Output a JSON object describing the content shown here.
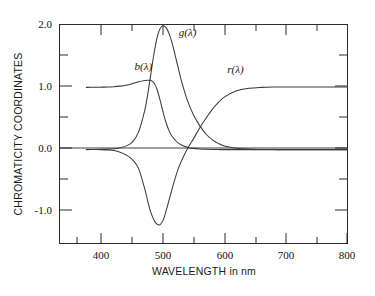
{
  "chart_data": {
    "type": "line",
    "title": "",
    "xlabel": "WAVELENGTH in nm",
    "ylabel": "CHROMATICITY COORDINATES",
    "xlim": [
      332,
      800
    ],
    "ylim": [
      -1.5,
      2.0
    ],
    "grid": false,
    "legend": "inline-curve-labels",
    "x_major_ticks": [
      400,
      500,
      600,
      700,
      800
    ],
    "x_minor_ticks": [
      375,
      450,
      550,
      650,
      750
    ],
    "x_tick_labels": [
      "400",
      "500",
      "600",
      "700",
      "800"
    ],
    "y_major_ticks": [
      -1.0,
      0.0,
      1.0,
      2.0
    ],
    "y_minor_ticks": [
      -0.5,
      0.5,
      1.5
    ],
    "y_tick_labels": [
      "-1.0",
      "0.0",
      "1.0",
      "2.0"
    ],
    "x": [
      375,
      390,
      400,
      410,
      420,
      430,
      440,
      450,
      460,
      470,
      475,
      480,
      485,
      490,
      495,
      500,
      505,
      510,
      515,
      520,
      525,
      530,
      540,
      550,
      560,
      570,
      580,
      590,
      600,
      620,
      640,
      660,
      680,
      700,
      730,
      760,
      800
    ],
    "series": [
      {
        "name": "b(λ)",
        "label": "b(λ)",
        "label_x": 468,
        "label_y": 1.28,
        "values": [
          0.995,
          0.997,
          0.999,
          1.0,
          1.005,
          1.015,
          1.03,
          1.055,
          1.085,
          1.105,
          1.11,
          1.105,
          1.07,
          0.97,
          0.8,
          0.6,
          0.43,
          0.3,
          0.21,
          0.15,
          0.105,
          0.075,
          0.04,
          0.02,
          0.01,
          0.005,
          0.002,
          0.001,
          0.0,
          0.0,
          0.0,
          0.0,
          0.0,
          0.0,
          0.0,
          0.0,
          0.0
        ]
      },
      {
        "name": "g(λ)",
        "label": "g(λ)",
        "label_x": 540,
        "label_y": 1.82,
        "values": [
          0.0,
          0.002,
          0.004,
          0.008,
          0.015,
          0.03,
          0.06,
          0.12,
          0.28,
          0.62,
          0.88,
          1.2,
          1.52,
          1.78,
          1.93,
          1.98,
          1.95,
          1.85,
          1.7,
          1.5,
          1.3,
          1.1,
          0.78,
          0.55,
          0.38,
          0.25,
          0.16,
          0.1,
          0.06,
          0.022,
          0.008,
          0.003,
          0.001,
          0.0,
          0.0,
          0.0,
          0.0
        ]
      },
      {
        "name": "r(λ)",
        "label": "r(λ)",
        "label_x": 618,
        "label_y": 1.22,
        "values": [
          0.003,
          0.002,
          0.0,
          -0.005,
          -0.015,
          -0.04,
          -0.085,
          -0.16,
          -0.3,
          -0.62,
          -0.82,
          -1.0,
          -1.12,
          -1.19,
          -1.2,
          -1.13,
          -0.98,
          -0.8,
          -0.62,
          -0.45,
          -0.3,
          -0.18,
          0.02,
          0.18,
          0.35,
          0.5,
          0.64,
          0.75,
          0.84,
          0.94,
          0.98,
          0.995,
          1.0,
          1.0,
          1.0,
          1.0,
          1.0
        ]
      }
    ]
  },
  "axis": {
    "x_title": "WAVELENGTH in nm",
    "y_title": "CHROMATICITY COORDINATES"
  },
  "ticks": {
    "x": [
      "400",
      "500",
      "600",
      "700",
      "800"
    ],
    "y": [
      "2.0",
      "1.0",
      "0.0",
      "-1.0"
    ]
  },
  "labels": {
    "b": "b(λ)",
    "g": "g(λ)",
    "r": "r(λ)"
  },
  "colors": {
    "background": "#ffffff",
    "axis": "#2b2b2b",
    "curve": "#3a3a3a",
    "text": "#111111"
  }
}
